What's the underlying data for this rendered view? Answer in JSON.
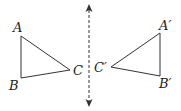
{
  "diagram": {
    "original": {
      "labels": {
        "a": "A",
        "b": "B",
        "c": "C"
      }
    },
    "image": {
      "labels": {
        "a": "A′",
        "b": "B′",
        "c": "C′"
      }
    },
    "mirror_line": {
      "style": "dashed",
      "arrows": "both"
    },
    "colors": {
      "stroke": "#333333",
      "text": "#222222"
    }
  }
}
